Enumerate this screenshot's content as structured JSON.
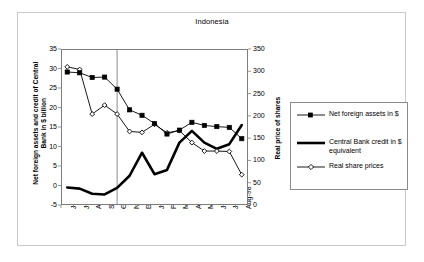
{
  "figure": {
    "title": "Indonesia",
    "border_color": "#c9c9c9",
    "plot_border_color": "#7d7d7d"
  },
  "axes": {
    "left": {
      "title": "Net foreign assets and credit of Central Bank in $ billion",
      "ticks": [
        "35",
        "30",
        "25",
        "20",
        "15",
        "10",
        "5",
        "0",
        "-5"
      ],
      "min": -5,
      "max": 35
    },
    "right": {
      "title": "Real price of shares",
      "ticks": [
        "350",
        "300",
        "250",
        "200",
        "150",
        "100",
        "50",
        "0"
      ],
      "min": 0,
      "max": 350
    },
    "x": {
      "labels": [
        "Jun-97",
        "Jul-97",
        "Aug-97",
        "Sep-97",
        "Oct-97",
        "Nov-97",
        "Dec-97",
        "Jan-98",
        "Feb-98",
        "Mar-98",
        "Apr-98",
        "May-98",
        "Jun-98",
        "Jul-98",
        "Aug-98"
      ]
    }
  },
  "legend": {
    "entries": [
      {
        "label": "Net foreign assets in $",
        "key": "square-marker-line"
      },
      {
        "label": "Central Bank credit in $ equivalent",
        "key": "thick-line"
      },
      {
        "label": "Real share prices",
        "key": "diamond-marker-line"
      }
    ]
  },
  "annotations": {
    "vline_at": "Oct-97"
  },
  "chart_data": {
    "type": "line",
    "title": "Indonesia",
    "xlabel": "",
    "ylabel": "Net foreign assets and credit of Central Bank in $ billion",
    "y2label": "Real price of shares",
    "ylim": [
      -5,
      35
    ],
    "y2lim": [
      0,
      350
    ],
    "grid": false,
    "legend_position": "right",
    "categories": [
      "Jun-97",
      "Jul-97",
      "Aug-97",
      "Sep-97",
      "Oct-97",
      "Nov-97",
      "Dec-97",
      "Jan-98",
      "Feb-98",
      "Mar-98",
      "Apr-98",
      "May-98",
      "Jun-98",
      "Jul-98",
      "Aug-98"
    ],
    "vertical_reference_line": "Oct-97",
    "series": [
      {
        "name": "Net foreign assets in $",
        "axis": "left",
        "marker": "filled-square",
        "values": [
          29.1,
          28.9,
          27.7,
          27.8,
          24.7,
          19.4,
          18.0,
          15.9,
          13.2,
          14.2,
          16.2,
          15.4,
          15.1,
          14.9,
          12.0
        ]
      },
      {
        "name": "Central Bank credit in $ equivalent",
        "axis": "left",
        "marker": "none",
        "values": [
          -0.5,
          -0.8,
          -2.1,
          -2.3,
          -0.6,
          2.5,
          8.4,
          2.9,
          4.0,
          11.0,
          14.0,
          11.0,
          9.4,
          10.6,
          15.5
        ]
      },
      {
        "name": "Real share prices",
        "axis": "right",
        "marker": "open-diamond",
        "values": [
          310,
          304,
          204,
          224,
          204,
          165,
          163,
          181,
          162,
          167,
          140,
          121,
          121,
          120,
          68
        ]
      }
    ]
  }
}
